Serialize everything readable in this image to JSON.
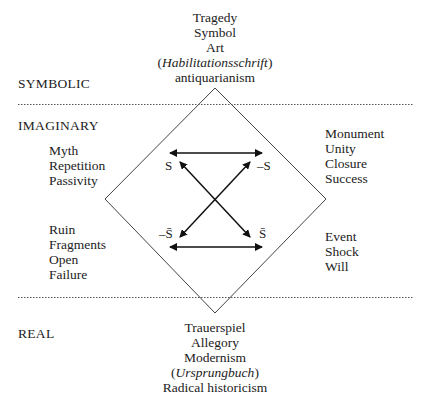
{
  "levels": {
    "symbolic": "SYMBOLIC",
    "imaginary": "IMAGINARY",
    "real": "REAL"
  },
  "top": {
    "lines": [
      "Tragedy",
      "Symbol",
      "Art"
    ],
    "paren_pre": "(",
    "paren_italic": "Habilitationsschrift",
    "paren_post": ")",
    "last": "antiquarianism"
  },
  "left_upper": [
    "Myth",
    "Repetition",
    "Passivity"
  ],
  "left_lower": [
    "Ruin",
    "Fragments",
    "Open",
    "Failure"
  ],
  "right_upper": [
    "Monument",
    "Unity",
    "Closure",
    "Success"
  ],
  "right_lower": [
    "Event",
    "Shock",
    "Will"
  ],
  "bottom": {
    "lines": [
      "Trauerspiel",
      "Allegory",
      "Modernism"
    ],
    "paren_pre": "(",
    "paren_italic": "Ursprungbuch",
    "paren_post": ")",
    "last": "Radical historicism"
  },
  "square": {
    "s": "S",
    "neg_s": "–S",
    "neg_s_bar": "–S̄",
    "s_bar": "S̄"
  }
}
